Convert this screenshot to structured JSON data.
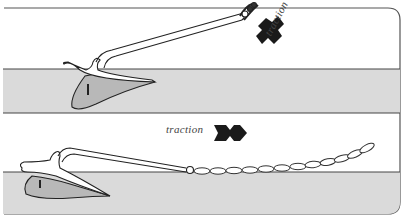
{
  "figure": {
    "panels": [
      {
        "id": "top",
        "description": "Anchor with steep rode angle, fluke barely set in seabed",
        "label": "traction",
        "arrow_direction": "up-right"
      },
      {
        "id": "bottom",
        "description": "Anchor with horizontal chain pull, fluke dug into seabed",
        "label": "traction",
        "arrow_direction": "right"
      }
    ],
    "colors": {
      "line": "#2a2a2a",
      "seabed": "#d9d9d9",
      "fluke": "#b5b5b5",
      "arrow": "#1a1a1a",
      "background": "#ffffff"
    }
  }
}
